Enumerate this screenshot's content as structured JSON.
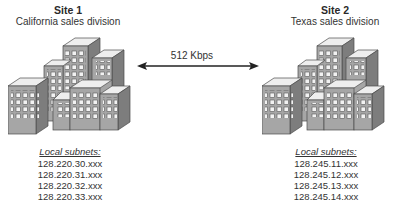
{
  "sites": [
    {
      "title": "Site 1",
      "subtitle": "California sales division",
      "icon": "office-buildings-icon",
      "subnets_heading": "Local subnets:",
      "subnets": [
        "128.220.30.xxx",
        "128.220.31.xxx",
        "128.220.32.xxx",
        "128.220.33.xxx"
      ]
    },
    {
      "title": "Site 2",
      "subtitle": "Texas sales division",
      "icon": "office-buildings-icon",
      "subnets_heading": "Local subnets:",
      "subnets": [
        "128.245.11.xxx",
        "128.245.12.xxx",
        "128.245.13.xxx",
        "128.245.14.xxx"
      ]
    }
  ],
  "link": {
    "label": "512 Kbps",
    "icon": "double-arrow-icon"
  },
  "colors": {
    "building_front": "#a6a6a6",
    "building_side": "#7d7d7d",
    "building_top": "#eeeeee",
    "window": "#f2f2f2",
    "outline": "#4a4a4a",
    "arrow": "#222222"
  }
}
